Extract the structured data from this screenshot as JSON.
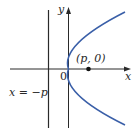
{
  "diagram": {
    "type": "parabola",
    "equation": "y^2 = 4px",
    "labels": {
      "y_axis": "y",
      "x_axis": "x",
      "origin": "0",
      "focus": "(p, 0)",
      "directrix": "x = −p"
    },
    "elements": {
      "parabola_color": "#3a5fa8",
      "axis_color": "#2a2a2a",
      "directrix_color": "#2a2a2a",
      "focus_point_color": "#111111"
    }
  }
}
